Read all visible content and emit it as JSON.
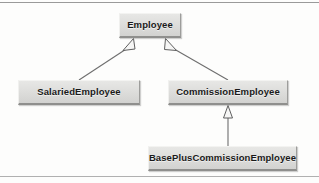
{
  "diagram": {
    "type": "uml-class-diagram",
    "title": "",
    "background_color": "#fdfdfc",
    "node_fill_color": "#dedede",
    "node_text_color": "#1a1a1a",
    "edge_color": "#6e6e6e",
    "nodes": [
      {
        "id": "employee",
        "label": "Employee",
        "x": 119,
        "y": 13,
        "w": 62,
        "h": 25
      },
      {
        "id": "salaried_employee",
        "label": "SalariedEmployee",
        "x": 18,
        "y": 80,
        "w": 122,
        "h": 25
      },
      {
        "id": "commission_employee",
        "label": "CommissionEmployee",
        "x": 168,
        "y": 80,
        "w": 120,
        "h": 25
      },
      {
        "id": "base_plus_commission_employee",
        "label": "BasePlusCommissionEmployee",
        "x": 148,
        "y": 146,
        "w": 149,
        "h": 25
      }
    ],
    "edges": [
      {
        "id": "salaried-extends-employee",
        "from": "salaried_employee",
        "to": "employee",
        "kind": "generalization",
        "arrowhead": "hollow-triangle"
      },
      {
        "id": "commission-extends-employee",
        "from": "commission_employee",
        "to": "employee",
        "kind": "generalization",
        "arrowhead": "hollow-triangle"
      },
      {
        "id": "baseplus-extends-commission",
        "from": "base_plus_commission_employee",
        "to": "commission_employee",
        "kind": "generalization",
        "arrowhead": "hollow-triangle"
      }
    ]
  }
}
